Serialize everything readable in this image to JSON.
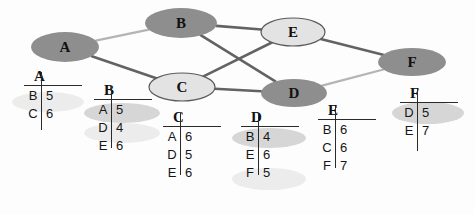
{
  "figure": {
    "kind": "graph-with-adjacency-lists",
    "colors": {
      "node_dark_fill": "#8e8e8e",
      "node_light_fill": "#e3e3e3",
      "node_stroke": "#5a5a5a",
      "edge_dark": "#636363",
      "edge_light": "#b4b4b4",
      "text": "#111111",
      "rule": "#2a2a2a",
      "highlight_gray": "#d6d6d6",
      "highlight_pale": "#ececec"
    }
  },
  "graph": {
    "nodes": [
      {
        "id": "A",
        "label": "A",
        "cx": 65,
        "cy": 47,
        "rx": 34,
        "ry": 15,
        "style": "dark"
      },
      {
        "id": "B",
        "label": "B",
        "cx": 181,
        "cy": 23,
        "rx": 36,
        "ry": 15,
        "style": "dark"
      },
      {
        "id": "C",
        "label": "C",
        "cx": 182,
        "cy": 87,
        "rx": 33,
        "ry": 14,
        "style": "light"
      },
      {
        "id": "D",
        "label": "D",
        "cx": 294,
        "cy": 93,
        "rx": 33,
        "ry": 14,
        "style": "dark"
      },
      {
        "id": "E",
        "label": "E",
        "cx": 293,
        "cy": 32,
        "rx": 32,
        "ry": 14,
        "style": "light"
      },
      {
        "id": "F",
        "label": "F",
        "cx": 412,
        "cy": 62,
        "rx": 34,
        "ry": 14,
        "style": "dark"
      }
    ],
    "edges": [
      {
        "from": "A",
        "to": "B",
        "weight": 5,
        "style": "light"
      },
      {
        "from": "A",
        "to": "C",
        "weight": 6,
        "style": "dark"
      },
      {
        "from": "B",
        "to": "E",
        "weight": 6,
        "style": "dark"
      },
      {
        "from": "B",
        "to": "D",
        "weight": 4,
        "style": "dark"
      },
      {
        "from": "C",
        "to": "E",
        "weight": 6,
        "style": "dark"
      },
      {
        "from": "C",
        "to": "D",
        "weight": 5,
        "style": "dark"
      },
      {
        "from": "E",
        "to": "F",
        "weight": 7,
        "style": "dark"
      },
      {
        "from": "D",
        "to": "F",
        "weight": 5,
        "style": "light"
      }
    ]
  },
  "adjacency_lists": [
    {
      "id": "A",
      "header": "A",
      "x": 24,
      "y": 72,
      "rule_width": 58,
      "vline_height": 58,
      "rows": [
        {
          "key": "B",
          "value": "5",
          "highlight": "pale"
        },
        {
          "key": "C",
          "value": "6",
          "highlight": "none"
        }
      ]
    },
    {
      "id": "B",
      "header": "B",
      "x": 94,
      "y": 86,
      "rule_width": 58,
      "vline_height": 62,
      "rows": [
        {
          "key": "A",
          "value": "5",
          "highlight": "gray"
        },
        {
          "key": "D",
          "value": "4",
          "highlight": "pale"
        },
        {
          "key": "E",
          "value": "6",
          "highlight": "none"
        }
      ]
    },
    {
      "id": "C",
      "header": "C",
      "x": 163,
      "y": 113,
      "rule_width": 58,
      "vline_height": 62,
      "rows": [
        {
          "key": "A",
          "value": "6",
          "highlight": "none"
        },
        {
          "key": "D",
          "value": "5",
          "highlight": "none"
        },
        {
          "key": "E",
          "value": "6",
          "highlight": "none"
        }
      ]
    },
    {
      "id": "D",
      "header": "D",
      "x": 241,
      "y": 113,
      "rule_width": 58,
      "vline_height": 62,
      "rows": [
        {
          "key": "B",
          "value": "4",
          "highlight": "gray"
        },
        {
          "key": "E",
          "value": "6",
          "highlight": "none"
        },
        {
          "key": "F",
          "value": "5",
          "highlight": "pale"
        }
      ]
    },
    {
      "id": "E",
      "header": "E",
      "x": 318,
      "y": 106,
      "rule_width": 58,
      "vline_height": 62,
      "rows": [
        {
          "key": "B",
          "value": "6",
          "highlight": "none"
        },
        {
          "key": "C",
          "value": "6",
          "highlight": "none"
        },
        {
          "key": "F",
          "value": "7",
          "highlight": "none"
        }
      ]
    },
    {
      "id": "F",
      "header": "F",
      "x": 400,
      "y": 89,
      "rule_width": 58,
      "vline_height": 62,
      "rows": [
        {
          "key": "D",
          "value": "5",
          "highlight": "gray"
        },
        {
          "key": "E",
          "value": "7",
          "highlight": "none"
        }
      ]
    }
  ],
  "smudges": [
    {
      "x": 12,
      "y": 92,
      "w": 72,
      "h": 20,
      "tone": "pale"
    },
    {
      "x": 84,
      "y": 103,
      "w": 76,
      "h": 20,
      "tone": "gray"
    },
    {
      "x": 84,
      "y": 123,
      "w": 76,
      "h": 20,
      "tone": "pale"
    },
    {
      "x": 232,
      "y": 128,
      "w": 74,
      "h": 20,
      "tone": "gray"
    },
    {
      "x": 232,
      "y": 168,
      "w": 74,
      "h": 22,
      "tone": "pale"
    },
    {
      "x": 392,
      "y": 102,
      "w": 72,
      "h": 22,
      "tone": "gray"
    }
  ]
}
